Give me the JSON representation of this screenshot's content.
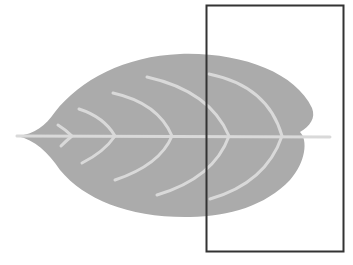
{
  "diagram": {
    "leaf_color": "#ababab",
    "vein_color": "#d9d9d9",
    "frame_color": "#333333",
    "background": "#ffffff",
    "frame": {
      "x": 206,
      "y": 5,
      "width": 137,
      "height": 246
    }
  }
}
